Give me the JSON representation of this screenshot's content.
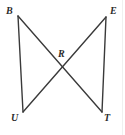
{
  "figure": {
    "background_color": "#ffffff",
    "stroke_color": "#3a3a3a",
    "label_color": "#2b2b2b",
    "width": 125,
    "height": 135,
    "points": {
      "B": {
        "label": "B",
        "x": 18,
        "y": 16,
        "label_x": 6,
        "label_y": 6
      },
      "E": {
        "label": "E",
        "x": 106,
        "y": 17,
        "label_x": 110,
        "label_y": 6
      },
      "R": {
        "label": "R",
        "x": 63,
        "y": 64,
        "label_x": 58,
        "label_y": 49
      },
      "U": {
        "label": "U",
        "x": 23,
        "y": 112,
        "label_x": 11,
        "label_y": 113
      },
      "T": {
        "label": "T",
        "x": 102,
        "y": 112,
        "label_x": 104,
        "label_y": 113
      }
    },
    "segments": [
      {
        "name": "segment-B-U",
        "from": "B",
        "to": "U"
      },
      {
        "name": "segment-E-T",
        "from": "E",
        "to": "T"
      },
      {
        "name": "segment-B-T",
        "from": "B",
        "to": "T"
      },
      {
        "name": "segment-E-U",
        "from": "E",
        "to": "U"
      }
    ]
  }
}
